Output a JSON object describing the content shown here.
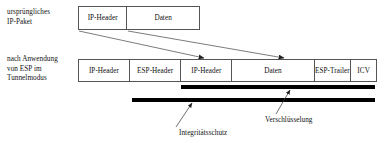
{
  "diagram": {
    "title": "ESP im Tunnelmodus",
    "labels": {
      "original_packet": "ursprüngliches\nIP-Paket",
      "after_esp": "nach Anwendung\nvon ESP im\nTunnelmodus"
    },
    "rows": [
      {
        "name": "original-packet",
        "fields": [
          {
            "label": "IP-Header",
            "width_pct": 40.2
          },
          {
            "label": "Daten",
            "width_pct": 59.8
          }
        ]
      },
      {
        "name": "esp-tunnel-packet",
        "fields": [
          {
            "label": "IP-Header",
            "width_pct": 17.1
          },
          {
            "label": "ESP-Header",
            "width_pct": 17.4
          },
          {
            "label": "IP-Header",
            "width_pct": 17.1
          },
          {
            "label": "Daten",
            "width_pct": 27.7
          },
          {
            "label": "ESP-Trailer",
            "width_pct": 12.4
          },
          {
            "label": "ICV",
            "width_pct": 8.3
          }
        ]
      }
    ],
    "coverage_bars": [
      {
        "name": "encryption-bar",
        "label": "Verschlüsselung",
        "color": "#000000"
      },
      {
        "name": "integrity-bar",
        "label": "Integritätsschutz",
        "color": "#000000"
      }
    ],
    "callouts": {
      "integrity": "Integritätsschutz",
      "encryption": "Verschlüsselung"
    },
    "colors": {
      "line": "#555555",
      "bar": "#000000",
      "text": "#111111",
      "background": "#ffffff"
    }
  }
}
